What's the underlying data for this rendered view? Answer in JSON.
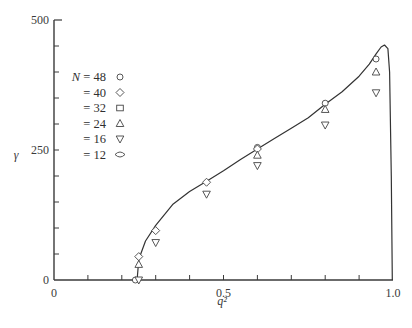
{
  "chart_data": {
    "type": "scatter",
    "title": "",
    "xlabel": "q²",
    "ylabel": "γ",
    "xlim": [
      0,
      1.0
    ],
    "ylim": [
      0,
      500
    ],
    "grid": false,
    "legend_position": "upper-left",
    "x_ticks": [
      "0",
      "0.5",
      "1.0"
    ],
    "y_ticks": [
      "0",
      "250",
      "500"
    ],
    "legend_title": "N",
    "series": [
      {
        "name": "N = 48",
        "marker": "circle",
        "x": [
          0.24,
          0.6,
          0.8,
          0.95
        ],
        "y": [
          0,
          255,
          340,
          425
        ]
      },
      {
        "name": "N = 40",
        "marker": "diamond",
        "x": [
          0.25,
          0.3,
          0.45,
          0.6
        ],
        "y": [
          45,
          95,
          188,
          252
        ]
      },
      {
        "name": "N = 32",
        "marker": "square",
        "x": [],
        "y": []
      },
      {
        "name": "N = 24",
        "marker": "triangle-up",
        "x": [
          0.25,
          0.6,
          0.8,
          0.95
        ],
        "y": [
          30,
          240,
          328,
          400
        ]
      },
      {
        "name": "N = 16",
        "marker": "triangle-down",
        "x": [
          0.25,
          0.3,
          0.45,
          0.6,
          0.8,
          0.95
        ],
        "y": [
          0,
          72,
          165,
          220,
          298,
          360
        ]
      },
      {
        "name": "N = 12",
        "marker": "lens",
        "x": [],
        "y": []
      }
    ],
    "curve": {
      "name": "theory",
      "x": [
        0.245,
        0.25,
        0.27,
        0.3,
        0.35,
        0.4,
        0.45,
        0.5,
        0.55,
        0.6,
        0.65,
        0.7,
        0.75,
        0.8,
        0.85,
        0.9,
        0.93,
        0.95,
        0.965,
        0.975,
        0.985,
        0.99,
        0.995,
        0.998
      ],
      "y": [
        0,
        40,
        75,
        105,
        145,
        170,
        190,
        210,
        232,
        252,
        272,
        292,
        312,
        338,
        362,
        392,
        415,
        435,
        448,
        452,
        445,
        400,
        200,
        0
      ]
    }
  },
  "legend": {
    "items": [
      {
        "label": "N = 48",
        "marker": "circle"
      },
      {
        "label": "= 40",
        "marker": "diamond"
      },
      {
        "label": "= 32",
        "marker": "square"
      },
      {
        "label": "= 24",
        "marker": "triangle-up"
      },
      {
        "label": "= 16",
        "marker": "triangle-down"
      },
      {
        "label": "= 12",
        "marker": "lens"
      }
    ]
  },
  "axes": {
    "x_title": "q²",
    "y_title": "γ",
    "x_tick_labels": [
      "0",
      "0.5",
      "1.0"
    ],
    "y_tick_labels": [
      "0",
      "250",
      "500"
    ]
  }
}
